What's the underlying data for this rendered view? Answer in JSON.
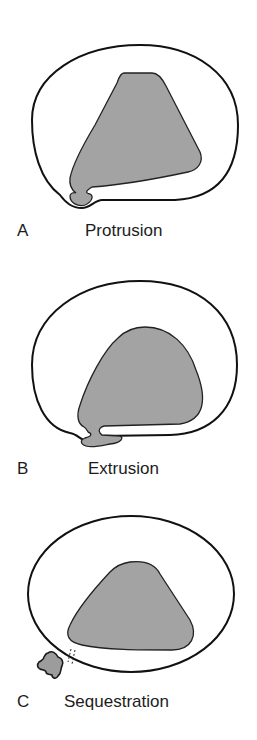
{
  "figure": {
    "colors": {
      "nucleus_fill": "#a3a3a3",
      "outline": "#111111",
      "background": "#ffffff",
      "label_text": "#1c1c1c"
    },
    "panels": [
      {
        "letter": "A",
        "title": "Protrusion"
      },
      {
        "letter": "B",
        "title": "Extrusion"
      },
      {
        "letter": "C",
        "title": "Sequestration"
      }
    ]
  }
}
